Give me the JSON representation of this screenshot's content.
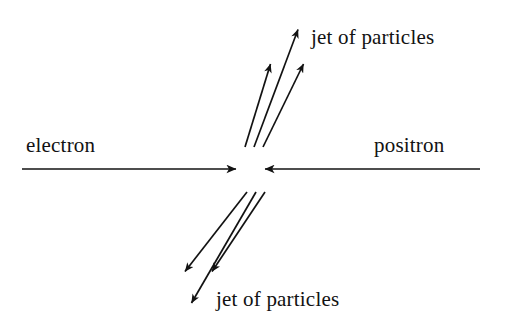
{
  "figure": {
    "type": "particle-collision-diagram",
    "background_color": "#ffffff",
    "stroke_color": "#121212",
    "labels": {
      "electron": "electron",
      "positron": "positron",
      "jet_upper": "jet of particles",
      "jet_lower": "jet of particles"
    },
    "beams": [
      {
        "name": "electron-beam",
        "label": "electron",
        "direction": "right",
        "x1": 22,
        "y1": 169,
        "x2": 243,
        "y2": 169
      },
      {
        "name": "positron-beam",
        "label": "positron",
        "direction": "left",
        "x1": 480,
        "y1": 169,
        "x2": 258,
        "y2": 169
      }
    ],
    "collision_point": {
      "x": 250,
      "y": 169
    },
    "jets": [
      {
        "name": "upper-jet",
        "label": "jet of particles",
        "arrows": [
          {
            "x1": 245,
            "y1": 147,
            "x2": 273,
            "y2": 57
          },
          {
            "x1": 254,
            "y1": 147,
            "x2": 301,
            "y2": 22
          },
          {
            "x1": 263,
            "y1": 147,
            "x2": 306,
            "y2": 57
          }
        ]
      },
      {
        "name": "lower-jet",
        "label": "jet of particles",
        "arrows": [
          {
            "x1": 247,
            "y1": 192,
            "x2": 179,
            "y2": 279
          },
          {
            "x1": 256,
            "y1": 192,
            "x2": 187,
            "y2": 311
          },
          {
            "x1": 265,
            "y1": 192,
            "x2": 206,
            "y2": 279
          }
        ]
      }
    ]
  }
}
